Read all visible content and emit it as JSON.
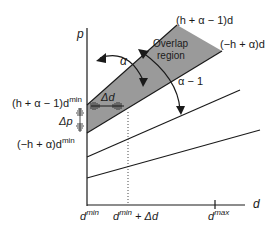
{
  "axes": {
    "y_label": "p",
    "x_label": "d",
    "x_ticks": [
      {
        "base": "d",
        "sup": "min",
        "suffix": ""
      },
      {
        "base": "d",
        "sup": "min",
        "suffix": " + Δd"
      },
      {
        "base": "d",
        "sup": "max",
        "suffix": ""
      }
    ]
  },
  "lines": {
    "upper": "(h + α − 1)d",
    "lower": "(−h + α)d"
  },
  "region": {
    "label_line1": "Overlap",
    "label_line2": "region",
    "fill_color": "#9a9a9a"
  },
  "annotations": {
    "alpha": "α",
    "alpha_minus_one": "α − 1",
    "delta_d": "Δd",
    "delta_p": "Δp",
    "upper_intercept": {
      "base": "(h + α − 1)d",
      "sup": "min"
    },
    "lower_intercept": {
      "base": "(−h + α)d",
      "sup": "min"
    }
  },
  "colors": {
    "ink": "#1a1a1a",
    "region": "#9a9a9a"
  }
}
